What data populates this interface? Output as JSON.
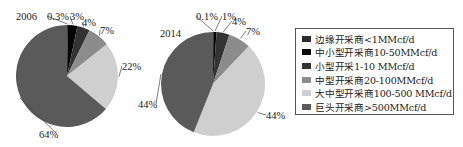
{
  "chart_data": [
    {
      "type": "pie",
      "title": "2006",
      "labels": [
        "边缘开采商<1MMcf/d",
        "中小型开采商10-50MMcf/d",
        "小型开采1-10 MMcf/d",
        "中型开采商20-100MMcf/d",
        "大中型开采商100-500 MMcf/d",
        "巨头开采商>500MMcf/d"
      ],
      "values": [
        0.3,
        3,
        4,
        7,
        22,
        64
      ],
      "value_labels": [
        "0.3%",
        "3%",
        "4%",
        "7%",
        "22%",
        "64%"
      ],
      "colors": [
        "#2b2b2b",
        "#050505",
        "#333333",
        "#8c8c8c",
        "#cfcfcf",
        "#5a5a5a"
      ]
    },
    {
      "type": "pie",
      "title": "2014",
      "labels": [
        "边缘开采商<1MMcf/d",
        "中小型开采商10-50MMcf/d",
        "小型开采1-10 MMcf/d",
        "中型开采商20-100MMcf/d",
        "大中型开采商100-500 MMcf/d",
        "巨头开采商>500MMcf/d"
      ],
      "values": [
        0.1,
        1,
        4,
        7,
        44,
        44
      ],
      "value_labels": [
        "0.1%",
        "1%",
        "4%",
        "7%",
        "44%",
        "44%"
      ],
      "colors": [
        "#2b2b2b",
        "#050505",
        "#333333",
        "#8c8c8c",
        "#cfcfcf",
        "#5a5a5a"
      ]
    }
  ],
  "legend": {
    "position": "right",
    "items": [
      {
        "label": "边缘开采商<1MMcf/d",
        "color": "#2b2b2b"
      },
      {
        "label": "中小型开采商10-50MMcf/d",
        "color": "#050505"
      },
      {
        "label": "小型开采1-10 MMcf/d",
        "color": "#333333"
      },
      {
        "label": "中型开采商20-100MMcf/d",
        "color": "#8c8c8c"
      },
      {
        "label": "大中型开采商100-500 MMcf/d",
        "color": "#cfcfcf"
      },
      {
        "label": "巨头开采商>500MMcf/d",
        "color": "#5a5a5a"
      }
    ]
  },
  "pies": [
    {
      "year": "2006",
      "cx": 67,
      "cy": 76,
      "r": 51,
      "title_pos": [
        16,
        20
      ],
      "label_pos": [
        [
          47,
          20
        ],
        [
          70,
          20
        ],
        [
          82,
          26
        ],
        [
          100,
          34
        ],
        [
          122,
          70
        ],
        [
          39,
          138
        ]
      ]
    },
    {
      "year": "2014",
      "cx": 213,
      "cy": 84,
      "r": 52,
      "title_pos": [
        160,
        37
      ],
      "label_pos": [
        [
          196,
          20
        ],
        [
          222,
          20
        ],
        [
          232,
          25
        ],
        [
          246,
          35
        ],
        [
          266,
          119
        ],
        [
          138,
          108
        ]
      ]
    }
  ]
}
